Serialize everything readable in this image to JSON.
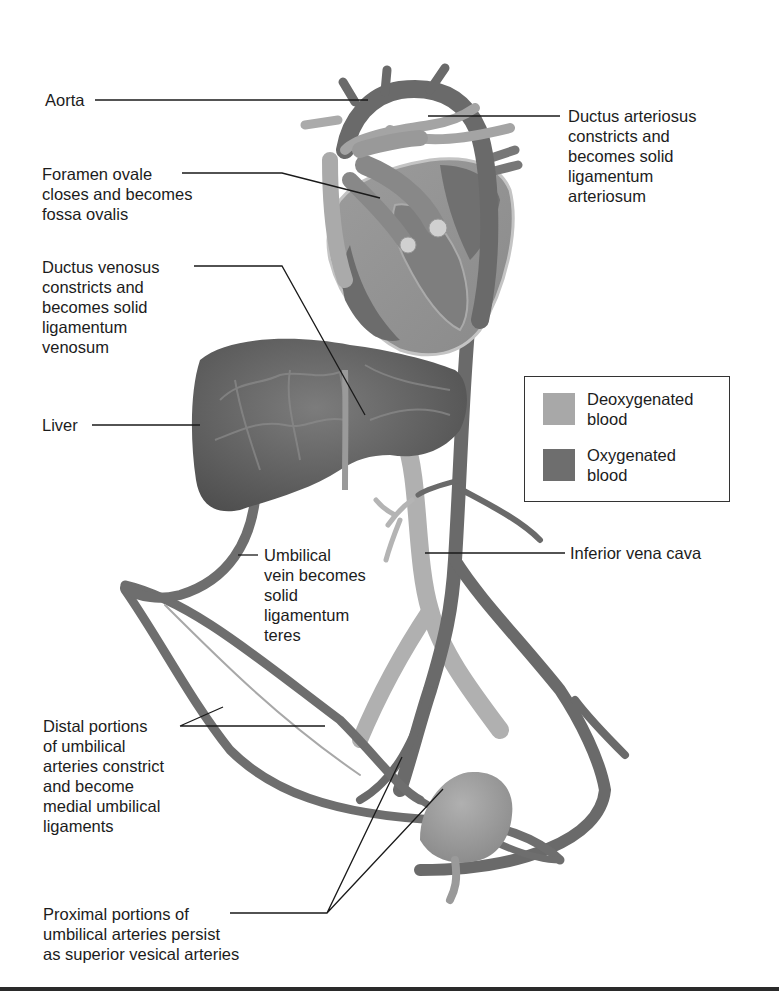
{
  "figure": {
    "colors": {
      "deoxygenated": "#a8a8a8",
      "oxygenated": "#6e6e6e",
      "liver": "#747474",
      "heart_wall": "#9a9a9a",
      "leader_line": "#1a1a1a"
    }
  },
  "labels": {
    "aorta": "Aorta",
    "foramen_ovale": "Foramen ovale\ncloses and becomes\nfossa ovalis",
    "ductus_venosus": "Ductus venosus\nconstricts and\nbecomes solid\nligamentum\nvenosum",
    "liver": "Liver",
    "ductus_arteriosus": "Ductus arteriosus\nconstricts and\nbecomes solid\nligamentum\narteriosum",
    "inferior_vena_cava": "Inferior vena cava",
    "umbilical_vein": "Umbilical\nvein becomes\nsolid\nligamentum\nteres",
    "distal_umbilical_arteries": "Distal portions\nof umbilical\narteries constrict\nand become\nmedial umbilical\nligaments",
    "proximal_umbilical_arteries": "Proximal portions of\numbilical arteries persist\nas superior vesical arteries"
  },
  "legend": {
    "items": [
      {
        "label": "Deoxygenated\nblood",
        "color": "#a8a8a8"
      },
      {
        "label": "Oxygenated\nblood",
        "color": "#6e6e6e"
      }
    ]
  }
}
